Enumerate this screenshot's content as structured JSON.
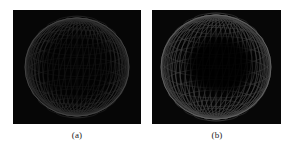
{
  "figure": {
    "background_color": "#ffffff",
    "width": 296,
    "height": 149,
    "type": "two-panel-image-figure"
  },
  "panels": [
    {
      "id": "panel-a",
      "caption": "(a)",
      "x": 13,
      "y": 10,
      "width": 128,
      "height": 114,
      "background_color": "#060606",
      "subject": "wireframe-ellipsoid-mesh",
      "description": "Dark rendered ellipsoid wireframe mesh, uniformly dim, faint quad grid across the whole surface",
      "mesh": {
        "center_x": 64,
        "center_y": 57,
        "radius_x": 52,
        "radius_y": 49,
        "meridians": 26,
        "parallels": 15,
        "line_color": "#2e2e2e",
        "rim_color": "#4a4a4a",
        "interior_fill": "#050505",
        "brightness": "low",
        "interior_darkening": 0.55
      },
      "caption_center_x": 77,
      "caption_y": 130
    },
    {
      "id": "panel-b",
      "caption": "(b)",
      "x": 152,
      "y": 10,
      "width": 129,
      "height": 114,
      "background_color": "#070707",
      "subject": "wireframe-ellipsoid-mesh",
      "description": "Brighter rendered ellipsoid wireframe mesh with a luminous annular ring of quad cells and a dark unlit center",
      "mesh": {
        "center_x": 64,
        "center_y": 57,
        "radius_x": 55,
        "radius_y": 52,
        "meridians": 26,
        "parallels": 15,
        "line_color": "#474747",
        "rim_color": "#6a6a6a",
        "interior_fill": "#050505",
        "brightness": "medium",
        "interior_darkening": 0.9,
        "dark_core_radius_x": 33,
        "dark_core_radius_y": 29,
        "dark_core_offset_x": 4,
        "dark_core_offset_y": -2
      },
      "caption_center_x": 217,
      "caption_y": 130
    }
  ]
}
